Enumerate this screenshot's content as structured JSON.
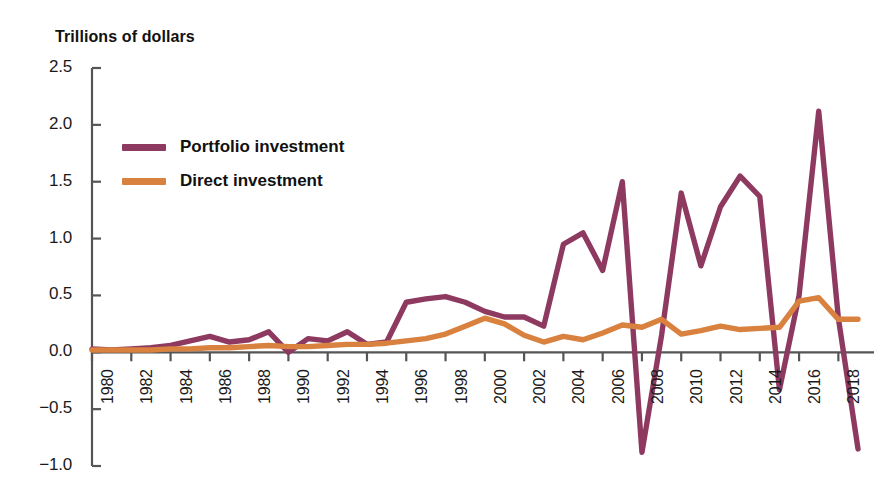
{
  "chart_data": {
    "type": "line",
    "title": "Trillions of dollars",
    "xlabel": "",
    "ylabel": "Trillions of dollars",
    "ylim": [
      -1.0,
      2.5
    ],
    "xlim": [
      1980,
      2019
    ],
    "grid": false,
    "legend_position": "upper-left",
    "ytick_labels": [
      "2.5",
      "2.0",
      "1.5",
      "1.0",
      "0.5",
      "0.0",
      "−0.5",
      "−1.0"
    ],
    "ytick_values": [
      2.5,
      2.0,
      1.5,
      1.0,
      0.5,
      0.0,
      -0.5,
      -1.0
    ],
    "xtick_labels": [
      "1980",
      "1982",
      "1984",
      "1986",
      "1988",
      "1990",
      "1992",
      "1994",
      "1996",
      "1998",
      "2000",
      "2002",
      "2004",
      "2006",
      "2008",
      "2010",
      "2012",
      "2014",
      "2016",
      "2018"
    ],
    "xtick_values": [
      1980,
      1982,
      1984,
      1986,
      1988,
      1990,
      1992,
      1994,
      1996,
      1998,
      2000,
      2002,
      2004,
      2006,
      2008,
      2010,
      2012,
      2014,
      2016,
      2018
    ],
    "x": [
      1980,
      1981,
      1982,
      1983,
      1984,
      1985,
      1986,
      1987,
      1988,
      1989,
      1990,
      1991,
      1992,
      1993,
      1994,
      1995,
      1996,
      1997,
      1998,
      1999,
      2000,
      2001,
      2002,
      2003,
      2004,
      2005,
      2006,
      2007,
      2008,
      2009,
      2010,
      2011,
      2012,
      2013,
      2014,
      2015,
      2016,
      2017,
      2018,
      2019
    ],
    "series": [
      {
        "name": "Portfolio investment",
        "color": "#8E3A60",
        "values": [
          0.03,
          0.02,
          0.03,
          0.04,
          0.06,
          0.1,
          0.14,
          0.09,
          0.11,
          0.18,
          0.0,
          0.12,
          0.1,
          0.18,
          0.07,
          0.09,
          0.44,
          0.47,
          0.49,
          0.44,
          0.36,
          0.31,
          0.31,
          0.23,
          0.95,
          1.05,
          0.72,
          1.5,
          -0.88,
          0.15,
          1.4,
          0.76,
          1.28,
          1.55,
          1.37,
          -0.33,
          0.5,
          2.12,
          0.3,
          -0.85
        ]
      },
      {
        "name": "Direct investment",
        "color": "#D9813F",
        "values": [
          0.02,
          0.02,
          0.02,
          0.02,
          0.03,
          0.03,
          0.04,
          0.04,
          0.05,
          0.06,
          0.05,
          0.05,
          0.06,
          0.07,
          0.07,
          0.08,
          0.1,
          0.12,
          0.16,
          0.23,
          0.3,
          0.25,
          0.15,
          0.09,
          0.14,
          0.11,
          0.17,
          0.24,
          0.22,
          0.29,
          0.16,
          0.19,
          0.23,
          0.2,
          0.21,
          0.22,
          0.45,
          0.48,
          0.29,
          0.29
        ]
      }
    ]
  },
  "legend": {
    "items": [
      {
        "label": "Portfolio investment",
        "color": "#8E3A60"
      },
      {
        "label": "Direct investment",
        "color": "#D9813F"
      }
    ]
  }
}
